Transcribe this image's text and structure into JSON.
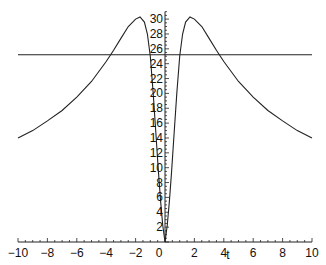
{
  "chart_data": {
    "type": "line",
    "title": "",
    "xlabel": "t",
    "ylabel": "",
    "xlim": [
      -10,
      10
    ],
    "ylim": [
      0,
      31
    ],
    "grid": false,
    "legend": null,
    "x_ticks": [
      -10,
      -8,
      -6,
      -4,
      -2,
      0,
      2,
      4,
      6,
      8,
      10
    ],
    "y_ticks": [
      2,
      4,
      6,
      8,
      10,
      12,
      14,
      16,
      18,
      20,
      22,
      24,
      26,
      28,
      30
    ],
    "series": [
      {
        "name": "f(t)",
        "x": [
          -10,
          -9,
          -8,
          -7,
          -6,
          -5,
          -4,
          -3.5,
          -3,
          -2.5,
          -2,
          -1.7,
          -1.4,
          -1.2,
          -1.0,
          -0.8,
          -0.6,
          -0.45,
          -0.3,
          -0.15,
          0,
          0.15,
          0.3,
          0.45,
          0.6,
          0.8,
          1.0,
          1.2,
          1.4,
          1.7,
          2,
          2.5,
          3,
          3.5,
          4,
          5,
          6,
          7,
          8,
          9,
          10
        ],
        "values": [
          14.0,
          15.0,
          16.3,
          17.7,
          19.5,
          21.6,
          24.3,
          25.8,
          27.4,
          29.0,
          30.0,
          30.3,
          29.6,
          28.0,
          25.0,
          20.0,
          14.0,
          9.5,
          5.5,
          2.2,
          0,
          2.2,
          5.5,
          9.5,
          14.0,
          20.0,
          25.0,
          28.0,
          29.6,
          30.3,
          30.0,
          29.0,
          27.4,
          25.8,
          24.3,
          21.6,
          19.5,
          17.7,
          16.3,
          15.0,
          14.0
        ]
      },
      {
        "name": "horizontal line",
        "x": [
          -10,
          10
        ],
        "values": [
          25.2,
          25.2
        ]
      }
    ]
  },
  "axes": {
    "x_label": "t",
    "x_tick_labels": [
      "−10",
      "−8",
      "−6",
      "−4",
      "−2",
      "0",
      "2",
      "4",
      "6",
      "8",
      "10"
    ],
    "y_tick_labels": [
      "2",
      "4",
      "6",
      "8",
      "10",
      "12",
      "14",
      "16",
      "18",
      "20",
      "22",
      "24",
      "26",
      "28",
      "30"
    ]
  }
}
